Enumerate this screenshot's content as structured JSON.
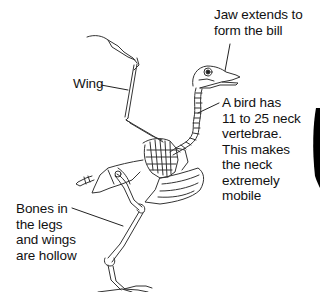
{
  "diagram": {
    "labels": {
      "jaw": "Jaw extends to\nform the bill",
      "wing": "Wing",
      "neck": "A bird has\n11 to 25 neck\nvertebrae.\nThis makes\nthe neck\nextremely\nmobile",
      "bones": "Bones in\nthe legs\nand wings\nare hollow"
    },
    "colors": {
      "background": "#ffffff",
      "line": "#222222",
      "text": "#111111",
      "edge_shape": "#000000"
    }
  }
}
